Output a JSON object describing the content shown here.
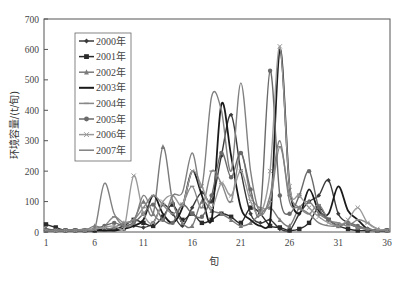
{
  "chart_data": {
    "type": "line",
    "title": "",
    "xlabel": "旬",
    "ylabel": "环境容量/(t/旬)",
    "xlim": [
      1,
      36
    ],
    "ylim": [
      0,
      700
    ],
    "x_ticks": [
      1,
      6,
      11,
      16,
      21,
      26,
      31,
      36
    ],
    "y_ticks": [
      0,
      100,
      200,
      300,
      400,
      500,
      600,
      700
    ],
    "grid": false,
    "legend_position": "upper-left-inside",
    "x": [
      1,
      2,
      3,
      4,
      5,
      6,
      7,
      8,
      9,
      10,
      11,
      12,
      13,
      14,
      15,
      16,
      17,
      18,
      19,
      20,
      21,
      22,
      23,
      24,
      25,
      26,
      27,
      28,
      29,
      30,
      31,
      32,
      33,
      34,
      35,
      36
    ],
    "series": [
      {
        "name": "2000年",
        "marker": "diamond",
        "color": "#3a3a3a",
        "values": [
          10,
          5,
          5,
          5,
          5,
          5,
          10,
          10,
          10,
          20,
          15,
          30,
          90,
          60,
          20,
          80,
          130,
          100,
          250,
          385,
          200,
          60,
          30,
          40,
          10,
          5,
          60,
          100,
          120,
          170,
          60,
          30,
          15,
          10,
          5,
          5
        ]
      },
      {
        "name": "2001年",
        "marker": "square",
        "color": "#2a2a2a",
        "values": [
          25,
          15,
          5,
          5,
          5,
          5,
          10,
          10,
          20,
          40,
          30,
          20,
          50,
          90,
          40,
          60,
          30,
          40,
          60,
          50,
          30,
          80,
          60,
          20,
          15,
          5,
          10,
          30,
          80,
          40,
          20,
          10,
          5,
          5,
          5,
          5
        ]
      },
      {
        "name": "2002年",
        "marker": "triangle",
        "color": "#7a7a7a",
        "values": [
          5,
          5,
          5,
          5,
          5,
          20,
          10,
          15,
          30,
          40,
          100,
          60,
          280,
          100,
          30,
          20,
          100,
          70,
          60,
          40,
          20,
          30,
          60,
          80,
          40,
          20,
          80,
          100,
          60,
          40,
          20,
          30,
          15,
          10,
          5,
          5
        ]
      },
      {
        "name": "2003年",
        "marker": "none",
        "color": "#1a1a1a",
        "values": [
          5,
          5,
          5,
          5,
          5,
          5,
          5,
          5,
          10,
          20,
          40,
          120,
          60,
          30,
          80,
          200,
          120,
          40,
          420,
          250,
          80,
          40,
          20,
          30,
          600,
          150,
          60,
          140,
          70,
          60,
          150,
          70,
          40,
          10,
          5,
          5
        ]
      },
      {
        "name": "2004年",
        "marker": "dash",
        "color": "#888888",
        "values": [
          5,
          5,
          5,
          5,
          10,
          10,
          20,
          50,
          30,
          40,
          80,
          120,
          90,
          60,
          90,
          150,
          80,
          200,
          160,
          100,
          260,
          120,
          80,
          100,
          280,
          120,
          80,
          60,
          90,
          40,
          30,
          20,
          40,
          30,
          10,
          5
        ]
      },
      {
        "name": "2005年",
        "marker": "circle",
        "color": "#6a6a6a",
        "values": [
          5,
          5,
          5,
          5,
          5,
          10,
          20,
          30,
          20,
          30,
          60,
          90,
          40,
          30,
          90,
          60,
          50,
          120,
          260,
          180,
          260,
          140,
          70,
          530,
          120,
          60,
          120,
          200,
          80,
          40,
          20,
          30,
          20,
          10,
          5,
          5
        ]
      },
      {
        "name": "2006年",
        "marker": "x",
        "color": "#9a9a9a",
        "values": [
          5,
          5,
          5,
          5,
          5,
          10,
          15,
          20,
          10,
          185,
          60,
          30,
          100,
          120,
          90,
          200,
          150,
          80,
          160,
          120,
          200,
          100,
          60,
          200,
          610,
          150,
          120,
          80,
          50,
          30,
          20,
          40,
          80,
          30,
          10,
          5
        ]
      },
      {
        "name": "2007年",
        "marker": "none",
        "color": "#808080",
        "values": [
          5,
          5,
          5,
          5,
          5,
          10,
          160,
          60,
          20,
          30,
          120,
          60,
          40,
          120,
          130,
          260,
          150,
          445,
          400,
          200,
          490,
          200,
          60,
          120,
          300,
          100,
          80,
          60,
          30,
          20,
          20,
          30,
          15,
          10,
          5,
          5
        ]
      }
    ]
  }
}
